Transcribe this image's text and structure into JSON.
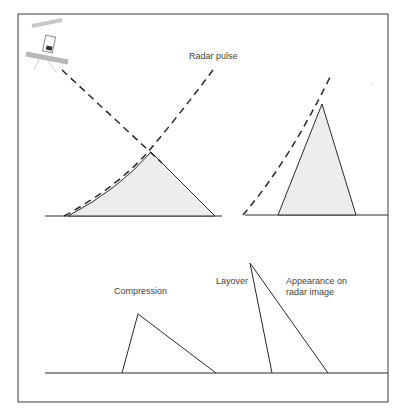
{
  "diagram": {
    "colors": {
      "stroke": "#2a2a2a",
      "terrain_fill": "#ededed",
      "label": "#444444",
      "satellite": "#b8b8b8"
    },
    "top_panel": {
      "labels": {
        "radar_pulse": "Radar pulse"
      },
      "hills": [
        {
          "name": "gentle-slope-hill",
          "base_left_x": 68,
          "base_right_x": 215,
          "peak": [
            151,
            152
          ]
        },
        {
          "name": "steep-hill",
          "base_left_x": 278,
          "base_right_x": 356,
          "peak": [
            322,
            104
          ]
        }
      ]
    },
    "bottom_panel": {
      "labels": {
        "compression": "Compression",
        "layover": "Layover",
        "appearance_line1": "Appearance on",
        "appearance_line2": "radar image"
      },
      "shapes": [
        {
          "name": "compression-triangle",
          "points": [
            [
              122,
              373
            ],
            [
              138,
              314
            ],
            [
              216,
              373
            ]
          ]
        },
        {
          "name": "layover-triangle",
          "points": [
            [
              272,
              373
            ],
            [
              250,
              263
            ],
            [
              328,
              373
            ]
          ]
        }
      ]
    }
  }
}
